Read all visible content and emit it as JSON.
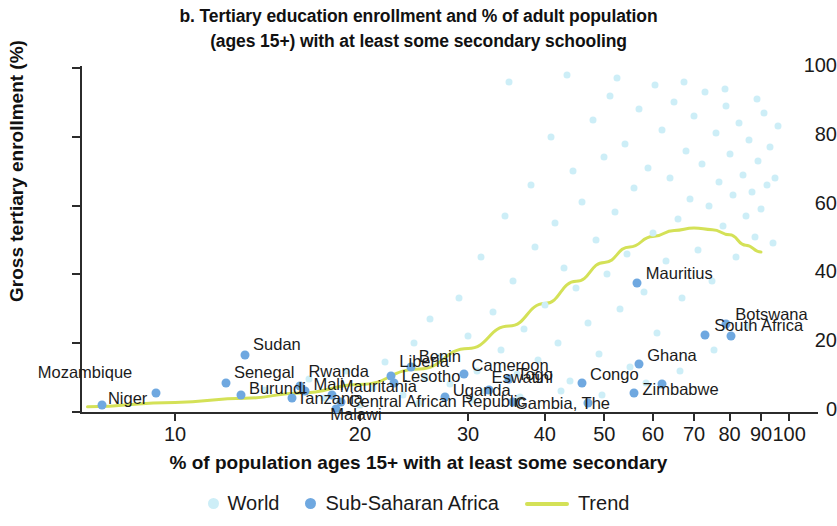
{
  "title": {
    "line1": "b. Tertiary education enrollment and % of adult population",
    "line2": "(ages 15+) with at least some secondary schooling"
  },
  "axes": {
    "ylabel": "Gross tertiary enrollment (%)",
    "xlabel": "% of population ages 15+ with at least some secondary",
    "yticks": [
      "0",
      "20",
      "40",
      "60",
      "80",
      "100"
    ],
    "xticks": [
      "10",
      "20",
      "30",
      "40",
      "50",
      "60",
      "70",
      "80",
      "90",
      "100"
    ]
  },
  "legend": {
    "world": "World",
    "ssa": "Sub-Saharan Africa",
    "trend": "Trend"
  },
  "colors": {
    "world": "#cdeef7",
    "ssa": "#6fa8e0",
    "trend": "#d4e157",
    "axis": "#2b2b2b"
  },
  "chart_data": {
    "type": "scatter",
    "title": "b. Tertiary education enrollment and % of adult population (ages 15+) with at least some secondary schooling",
    "xlabel": "% of population ages 15+ with at least some secondary",
    "ylabel": "Gross tertiary enrollment (%)",
    "xscale": "log",
    "xlim": [
      7,
      100
    ],
    "ylim": [
      0,
      100
    ],
    "grid": false,
    "legend_position": "bottom",
    "series": [
      {
        "name": "Sub-Saharan Africa",
        "color": "#6fa8e0",
        "labeled_points": [
          {
            "label": "Niger",
            "x": 7.6,
            "y": 2.0,
            "lx": 12,
            "ly": 58
          },
          {
            "label": "Mozambique",
            "x": 9.3,
            "y": 5.5,
            "lx": 13,
            "ly": 44
          },
          {
            "label": "Sudan",
            "x": 13.0,
            "y": 16.5,
            "lx": 120,
            "ly": 25
          },
          {
            "label": "Senegal",
            "x": 12.1,
            "y": 8.4,
            "lx": 108,
            "ly": 40
          },
          {
            "label": "Burundi",
            "x": 12.8,
            "y": 5.0,
            "lx": 113,
            "ly": 53
          },
          {
            "label": "Rwanda",
            "x": 16.0,
            "y": 7.5,
            "lx": 209,
            "ly": 36
          },
          {
            "label": "Mali",
            "x": 16.3,
            "y": 6.0,
            "lx": 212,
            "ly": 47
          },
          {
            "label": "Tanzania",
            "x": 15.5,
            "y": 4.0,
            "lx": 192,
            "ly": 56
          },
          {
            "label": "Mauritania",
            "x": 18.0,
            "y": 5.0,
            "lx": 240,
            "ly": 47
          },
          {
            "label": "Central African Republic",
            "x": 18.6,
            "y": 3.0,
            "lx": 244,
            "ly": 58
          },
          {
            "label": "Malawi",
            "x": 18.3,
            "y": 0.8,
            "lx": 273,
            "ly": 68
          },
          {
            "label": "Liberia",
            "x": 22.5,
            "y": 10.5,
            "lx": 330,
            "ly": 33
          },
          {
            "label": "Lesotho",
            "x": 22.7,
            "y": 8.5,
            "lx": 330,
            "ly": 44
          },
          {
            "label": "Benin",
            "x": 24.2,
            "y": 13.0,
            "lx": 375,
            "ly": 28
          },
          {
            "label": "Cameroon",
            "x": 29.5,
            "y": 11.0,
            "lx": 418,
            "ly": 35
          },
          {
            "label": "Uganda",
            "x": 27.5,
            "y": 4.5,
            "lx": 400,
            "ly": 53
          },
          {
            "label": "Eswatini",
            "x": 32.5,
            "y": 6.5,
            "lx": 447,
            "ly": 44
          },
          {
            "label": "Togo",
            "x": 35.0,
            "y": 9.5,
            "lx": 468,
            "ly": 36
          },
          {
            "label": "Gambia, The",
            "x": 35.5,
            "y": 3.0,
            "lx": 452,
            "ly": 57
          },
          {
            "label": "Congo",
            "x": 46.0,
            "y": 8.5,
            "lx": 530,
            "ly": 44
          },
          {
            "label": "Zimbabwe",
            "x": 56.0,
            "y": 5.5,
            "lx": 568,
            "ly": 54
          },
          {
            "label": "Ghana",
            "x": 57.0,
            "y": 14.0,
            "lx": 587,
            "ly": 27
          },
          {
            "label": "Mauritius",
            "x": 56.5,
            "y": 37.5,
            "lx": 590,
            "ly": -38
          },
          {
            "label": "South Africa",
            "x": 73.0,
            "y": 22.5,
            "lx": 658,
            "ly": 2
          },
          {
            "label": "Botswana",
            "x": 79.0,
            "y": 25.5,
            "lx": 684,
            "ly": -14
          }
        ],
        "unlabeled_points": [
          {
            "x": 47.0,
            "y": 2.5
          },
          {
            "x": 80.5,
            "y": 22.0
          },
          {
            "x": 62.0,
            "y": 8.0
          }
        ]
      },
      {
        "name": "World",
        "color": "#cdeef7",
        "note": "Global country cloud; dense at 25-90% secondary, enrollment 5-100%",
        "points": [
          {
            "x": 16.5,
            "y": 9.5
          },
          {
            "x": 19.0,
            "y": 12.0
          },
          {
            "x": 21.0,
            "y": 7.0
          },
          {
            "x": 22.0,
            "y": 14.5
          },
          {
            "x": 23.5,
            "y": 5.0
          },
          {
            "x": 24.5,
            "y": 20.0
          },
          {
            "x": 25.5,
            "y": 10.0
          },
          {
            "x": 26.0,
            "y": 27.0
          },
          {
            "x": 27.0,
            "y": 16.0
          },
          {
            "x": 28.0,
            "y": 8.0
          },
          {
            "x": 29.0,
            "y": 33.0
          },
          {
            "x": 30.0,
            "y": 22.0
          },
          {
            "x": 31.0,
            "y": 12.0
          },
          {
            "x": 31.5,
            "y": 45.0
          },
          {
            "x": 32.0,
            "y": 6.0
          },
          {
            "x": 33.0,
            "y": 29.0
          },
          {
            "x": 34.0,
            "y": 18.0
          },
          {
            "x": 34.5,
            "y": 57.0
          },
          {
            "x": 35.5,
            "y": 38.0
          },
          {
            "x": 36.0,
            "y": 11.0
          },
          {
            "x": 37.0,
            "y": 24.0
          },
          {
            "x": 38.0,
            "y": 66.0
          },
          {
            "x": 38.5,
            "y": 48.0
          },
          {
            "x": 39.0,
            "y": 15.0
          },
          {
            "x": 40.0,
            "y": 31.0
          },
          {
            "x": 41.0,
            "y": 80.0
          },
          {
            "x": 41.5,
            "y": 55.0
          },
          {
            "x": 42.0,
            "y": 20.0
          },
          {
            "x": 43.0,
            "y": 42.0
          },
          {
            "x": 44.0,
            "y": 9.0
          },
          {
            "x": 44.5,
            "y": 70.0
          },
          {
            "x": 45.0,
            "y": 36.0
          },
          {
            "x": 46.0,
            "y": 61.0
          },
          {
            "x": 47.0,
            "y": 26.0
          },
          {
            "x": 48.0,
            "y": 85.0
          },
          {
            "x": 48.5,
            "y": 50.0
          },
          {
            "x": 49.0,
            "y": 17.0
          },
          {
            "x": 50.0,
            "y": 74.0
          },
          {
            "x": 50.5,
            "y": 40.0
          },
          {
            "x": 51.0,
            "y": 92.0
          },
          {
            "x": 52.0,
            "y": 58.0
          },
          {
            "x": 53.0,
            "y": 30.0
          },
          {
            "x": 54.0,
            "y": 78.0
          },
          {
            "x": 54.5,
            "y": 46.0
          },
          {
            "x": 55.0,
            "y": 13.0
          },
          {
            "x": 56.0,
            "y": 65.0
          },
          {
            "x": 57.0,
            "y": 88.0
          },
          {
            "x": 58.0,
            "y": 35.0
          },
          {
            "x": 59.0,
            "y": 71.0
          },
          {
            "x": 60.0,
            "y": 52.0
          },
          {
            "x": 60.5,
            "y": 95.0
          },
          {
            "x": 61.0,
            "y": 23.0
          },
          {
            "x": 62.0,
            "y": 82.0
          },
          {
            "x": 63.0,
            "y": 44.0
          },
          {
            "x": 64.0,
            "y": 68.0
          },
          {
            "x": 65.0,
            "y": 90.0
          },
          {
            "x": 66.0,
            "y": 56.0
          },
          {
            "x": 67.0,
            "y": 33.0
          },
          {
            "x": 68.0,
            "y": 76.0
          },
          {
            "x": 69.0,
            "y": 62.0
          },
          {
            "x": 70.0,
            "y": 86.0
          },
          {
            "x": 71.0,
            "y": 47.0
          },
          {
            "x": 72.0,
            "y": 72.0
          },
          {
            "x": 73.0,
            "y": 93.0
          },
          {
            "x": 74.0,
            "y": 60.0
          },
          {
            "x": 75.0,
            "y": 38.0
          },
          {
            "x": 76.0,
            "y": 81.0
          },
          {
            "x": 77.0,
            "y": 67.0
          },
          {
            "x": 78.0,
            "y": 54.0
          },
          {
            "x": 79.0,
            "y": 89.0
          },
          {
            "x": 80.0,
            "y": 75.0
          },
          {
            "x": 81.0,
            "y": 63.0
          },
          {
            "x": 82.0,
            "y": 45.0
          },
          {
            "x": 83.0,
            "y": 84.0
          },
          {
            "x": 84.0,
            "y": 69.0
          },
          {
            "x": 85.0,
            "y": 57.0
          },
          {
            "x": 86.0,
            "y": 79.0
          },
          {
            "x": 87.0,
            "y": 64.0
          },
          {
            "x": 88.0,
            "y": 51.0
          },
          {
            "x": 89.0,
            "y": 73.0
          },
          {
            "x": 90.0,
            "y": 59.0
          },
          {
            "x": 91.0,
            "y": 87.0
          },
          {
            "x": 92.0,
            "y": 66.0
          },
          {
            "x": 93.0,
            "y": 77.0
          },
          {
            "x": 94.0,
            "y": 49.0
          },
          {
            "x": 95.0,
            "y": 68.0
          },
          {
            "x": 96.0,
            "y": 83.0
          },
          {
            "x": 25.0,
            "y": 2.5
          },
          {
            "x": 30.5,
            "y": 3.5
          },
          {
            "x": 36.5,
            "y": 4.5
          },
          {
            "x": 42.5,
            "y": 6.0
          },
          {
            "x": 49.5,
            "y": 5.0
          },
          {
            "x": 58.5,
            "y": 8.5
          },
          {
            "x": 66.5,
            "y": 12.0
          },
          {
            "x": 75.5,
            "y": 18.0
          },
          {
            "x": 85.5,
            "y": 25.0
          },
          {
            "x": 14.0,
            "y": 6.5
          },
          {
            "x": 17.5,
            "y": 4.0
          },
          {
            "x": 20.0,
            "y": 2.0
          },
          {
            "x": 43.5,
            "y": 98.0
          },
          {
            "x": 52.5,
            "y": 97.0
          },
          {
            "x": 67.5,
            "y": 96.0
          },
          {
            "x": 78.5,
            "y": 94.0
          },
          {
            "x": 88.5,
            "y": 91.0
          },
          {
            "x": 35.0,
            "y": 96.0
          }
        ]
      },
      {
        "name": "Trend",
        "type": "line",
        "color": "#d4e157",
        "points": [
          {
            "x": 7.2,
            "y": 1.5
          },
          {
            "x": 10,
            "y": 2.8
          },
          {
            "x": 13,
            "y": 4.0
          },
          {
            "x": 16,
            "y": 5.5
          },
          {
            "x": 20,
            "y": 8.0
          },
          {
            "x": 25,
            "y": 12.5
          },
          {
            "x": 30,
            "y": 18.5
          },
          {
            "x": 35,
            "y": 25.0
          },
          {
            "x": 40,
            "y": 31.5
          },
          {
            "x": 45,
            "y": 38.0
          },
          {
            "x": 50,
            "y": 43.5
          },
          {
            "x": 55,
            "y": 48.0
          },
          {
            "x": 60,
            "y": 51.0
          },
          {
            "x": 65,
            "y": 52.8
          },
          {
            "x": 70,
            "y": 53.5
          },
          {
            "x": 75,
            "y": 53.0
          },
          {
            "x": 80,
            "y": 51.5
          },
          {
            "x": 85,
            "y": 48.5
          },
          {
            "x": 90,
            "y": 46.5
          }
        ]
      }
    ]
  }
}
